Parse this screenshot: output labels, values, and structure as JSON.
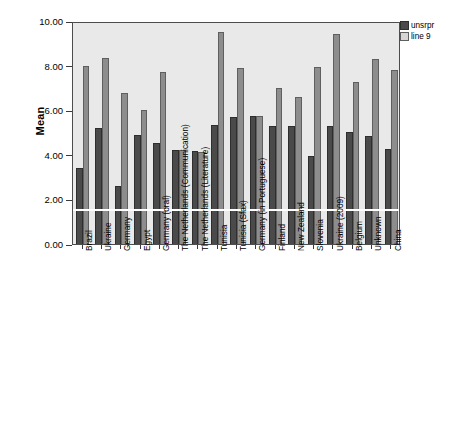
{
  "chart_data": {
    "type": "bar",
    "title": "",
    "subtitle": "",
    "xlabel": "",
    "ylabel": "Mean",
    "ylim": [
      0,
      10
    ],
    "ytick_labels": [
      "10.00",
      "8.00",
      "6.00",
      "4.00",
      "2.00",
      "0.00"
    ],
    "ytick_values": [
      10,
      8,
      6,
      4,
      2,
      0
    ],
    "grid": false,
    "legend_position": "top-right",
    "reference_line": {
      "value": 1.5,
      "orientation": "horizontal",
      "color": "#ffffff"
    },
    "colors": {
      "unsrpr": "#4a4a4a",
      "line_9": "#8d8d8d",
      "plot_background": "#e9e9e9",
      "frame": "#4d4d4d",
      "page_background": "#ffffff"
    },
    "categories": [
      "Brazil",
      "Ukraine",
      "Germany",
      "Egypt",
      "Germany (oral)",
      "The Netherlands (Communication)",
      "The Netherlands (Literature)",
      "Tunisia",
      "Tunisia (Sfax)",
      "Germany (in Portuguese)",
      "Finland",
      "New Zealand",
      "Slovenia",
      "Ukraine (2009)",
      "Belgium",
      "Unknown",
      "China"
    ],
    "series": [
      {
        "name": "unsrpr",
        "values": [
          3.4,
          5.2,
          2.6,
          4.9,
          4.55,
          4.2,
          4.15,
          5.35,
          5.7,
          5.75,
          5.3,
          5.3,
          3.95,
          5.28,
          5.02,
          4.85,
          4.25
        ]
      },
      {
        "name": "line 9",
        "values": [
          8.0,
          8.35,
          6.78,
          6.02,
          7.7,
          4.2,
          4.12,
          9.5,
          7.88,
          5.75,
          6.98,
          6.58,
          7.92,
          9.4,
          7.25,
          8.28,
          7.8
        ]
      }
    ]
  },
  "legend": {
    "entries": [
      {
        "label": "unsrpr",
        "swatch": "dark"
      },
      {
        "label": "line 9",
        "swatch": "light"
      }
    ]
  }
}
